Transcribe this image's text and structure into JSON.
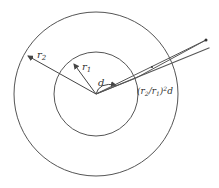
{
  "diagram": {
    "labels": {
      "outer_radius": "r",
      "outer_radius_sub": "2",
      "inner_radius": "r",
      "inner_radius_sub": "1",
      "inner_distance": "d",
      "outer_distance_prefix": "(r",
      "outer_distance_sub1": "2",
      "outer_distance_mid": "/r",
      "outer_distance_sub2": "1",
      "outer_distance_suffix": ")",
      "outer_distance_sup": "2",
      "outer_distance_var": "d"
    },
    "colors": {
      "stroke": "#555555",
      "background": "#ffffff"
    }
  }
}
